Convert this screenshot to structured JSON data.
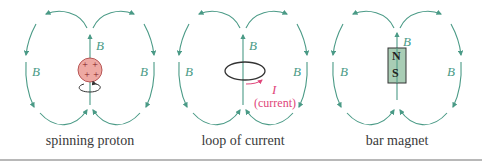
{
  "colors": {
    "field": "#4a9a86",
    "proton_fill": "#eea9a3",
    "current": "#e0457a",
    "magnet_fill": "#a9cdb5",
    "text": "#3a3a3a"
  },
  "panels": [
    {
      "caption": "spinning proton",
      "field_label": "B",
      "left_label": "B",
      "right_label": "B",
      "charges": [
        "+",
        "+",
        "+",
        "+"
      ]
    },
    {
      "caption": "loop of current",
      "field_label": "B",
      "left_label": "B",
      "right_label": "B",
      "current_symbol": "I",
      "current_label": "(current)"
    },
    {
      "caption": "bar magnet",
      "field_label": "B",
      "left_label": "B",
      "right_label": "B",
      "north": "N",
      "south": "S"
    }
  ]
}
